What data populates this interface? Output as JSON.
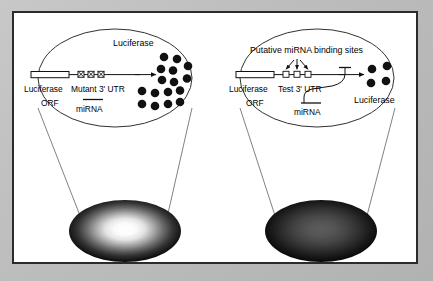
{
  "figure": {
    "background_color": "#b9b9b9",
    "frame_color": "#2b2b2b",
    "panel_color": "#ffffff"
  },
  "panels": [
    {
      "id": "left",
      "name": "mutant-utr-panel",
      "title_label": "Luciferase",
      "orf_label_line1": "Luciferase",
      "orf_label_line2": "ORF",
      "utr_label": "Mutant 3' UTR",
      "mirna_label": "miRNA",
      "binding_sites": 3,
      "binding_sites_mutated": true,
      "luciferase_dots": 16,
      "well_brightness": "bright",
      "well_center_color": "#ffffff",
      "well_edge_color": "#101010"
    },
    {
      "id": "right",
      "name": "test-utr-panel",
      "title_label": "Putative miRNA binding sites",
      "orf_label_line1": "Luciferase",
      "orf_label_line2": "ORF",
      "utr_label": "Test 3' UTR",
      "mirna_label": "miRNA",
      "product_label": "Luciferase",
      "binding_sites": 3,
      "binding_sites_mutated": false,
      "binding_arrows": 3,
      "luciferase_dots": 4,
      "repression": true,
      "well_brightness": "dim",
      "well_center_color": "#4a4a4a",
      "well_edge_color": "#080808"
    }
  ],
  "colors": {
    "ink": "#000000",
    "line": "#1a1a1a",
    "dot": "#111111"
  }
}
